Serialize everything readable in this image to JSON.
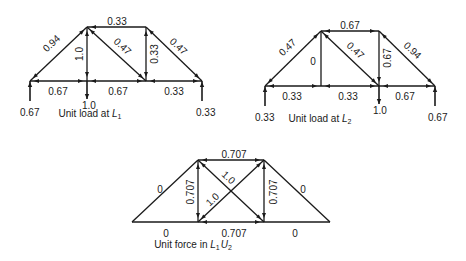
{
  "figure": {
    "trusses": [
      {
        "id": "unit-load-L1",
        "caption": "Unit load at ",
        "caption_sym": "L",
        "caption_sub": "1",
        "caption_sym2": "",
        "caption_sub2": "",
        "caption_pos": [
          90,
          117
        ],
        "nodes": {
          "L0": [
            30,
            81
          ],
          "U1": [
            87,
            27
          ],
          "L1": [
            87,
            81
          ],
          "U2": [
            146,
            27
          ],
          "L2": [
            146,
            81
          ],
          "L3": [
            202,
            81
          ]
        },
        "members": [
          {
            "from": "L0",
            "to": "U1",
            "label": "0.94",
            "lpos": [
              52,
              44
            ],
            "rot": -43,
            "arrows": [
              "L0",
              "U1"
            ]
          },
          {
            "from": "U1",
            "to": "L1",
            "label": "1.0",
            "lpos": [
              80,
              54
            ],
            "rot": -90,
            "arrows": [
              "U1",
              "L1"
            ]
          },
          {
            "from": "U1",
            "to": "U2",
            "label": "0.33",
            "lpos": [
              117,
              22
            ],
            "rot": 0,
            "arrows": [
              "U1"
            ]
          },
          {
            "from": "U1",
            "to": "L2",
            "label": "0.47",
            "lpos": [
              122,
              47
            ],
            "rot": 43,
            "arrows": [
              "U1",
              "L2"
            ]
          },
          {
            "from": "U2",
            "to": "L2",
            "label": "0.33",
            "lpos": [
              155,
              54
            ],
            "rot": -90,
            "arrows": [
              "U2",
              "L2"
            ]
          },
          {
            "from": "U2",
            "to": "L3",
            "label": "0.47",
            "lpos": [
              178,
              47
            ],
            "rot": 43,
            "arrows": [
              "U2",
              "L3"
            ]
          },
          {
            "from": "L0",
            "to": "L1",
            "label": "0.67",
            "lpos": [
              58,
              92
            ],
            "rot": 0,
            "arrows": [
              "L0",
              "L1"
            ]
          },
          {
            "from": "L1",
            "to": "L2",
            "label": "0.67",
            "lpos": [
              118,
              92
            ],
            "rot": 0,
            "arrows": [
              "L1",
              "L2"
            ]
          },
          {
            "from": "L2",
            "to": "L3",
            "label": "0.33",
            "lpos": [
              174,
              92
            ],
            "rot": 0,
            "arrows": [
              "L2",
              "L3"
            ]
          }
        ],
        "loads": [
          {
            "node": "L0",
            "dir": "up",
            "len": 20,
            "label": "0.67",
            "lpos": [
              20,
              116
            ]
          },
          {
            "node": "L1",
            "dir": "down",
            "len": 18,
            "label": "1.0",
            "lpos": [
              82,
              109
            ]
          },
          {
            "node": "L3",
            "dir": "up",
            "len": 20,
            "label": "0.33",
            "lpos": [
              196,
              116
            ]
          }
        ]
      },
      {
        "id": "unit-load-L2",
        "caption": "Unit load at ",
        "caption_sym": "L",
        "caption_sub": "2",
        "caption_sym2": "",
        "caption_sub2": "",
        "caption_pos": [
          320,
          122
        ],
        "nodes": {
          "L0": [
            265,
            86
          ],
          "U1": [
            321,
            31
          ],
          "L1": [
            321,
            86
          ],
          "U2": [
            379,
            31
          ],
          "L2": [
            379,
            86
          ],
          "L3": [
            435,
            86
          ]
        },
        "members": [
          {
            "from": "L0",
            "to": "U1",
            "label": "0.47",
            "lpos": [
              288,
              48
            ],
            "rot": -43,
            "arrows": [
              "L0",
              "U1"
            ]
          },
          {
            "from": "U1",
            "to": "L1",
            "label": "0",
            "lpos": [
              313,
              62
            ],
            "rot": 0,
            "arrows": []
          },
          {
            "from": "U1",
            "to": "U2",
            "label": "0.67",
            "lpos": [
              350,
              26
            ],
            "rot": 0,
            "arrows": [
              "U1",
              "U2"
            ]
          },
          {
            "from": "U1",
            "to": "L2",
            "label": "0.47",
            "lpos": [
              355,
              51
            ],
            "rot": 43,
            "arrows": [
              "U1",
              "L2"
            ]
          },
          {
            "from": "U2",
            "to": "L2",
            "label": "0.67",
            "lpos": [
              388,
              58
            ],
            "rot": -90,
            "arrows": [
              "L2"
            ]
          },
          {
            "from": "U2",
            "to": "L3",
            "label": "0.94",
            "lpos": [
              412,
              51
            ],
            "rot": 43,
            "arrows": [
              "U2",
              "L3"
            ]
          },
          {
            "from": "L0",
            "to": "L1",
            "label": "0.33",
            "lpos": [
              292,
              97
            ],
            "rot": 0,
            "arrows": [
              "L0",
              "L1"
            ]
          },
          {
            "from": "L1",
            "to": "L2",
            "label": "0.33",
            "lpos": [
              348,
              97
            ],
            "rot": 0,
            "arrows": [
              "L1",
              "L2"
            ]
          },
          {
            "from": "L2",
            "to": "L3",
            "label": "0.67",
            "lpos": [
              405,
              97
            ],
            "rot": 0,
            "arrows": [
              "L2",
              "L3"
            ]
          }
        ],
        "loads": [
          {
            "node": "L0",
            "dir": "up",
            "len": 20,
            "label": "0.33",
            "lpos": [
              255,
              121
            ]
          },
          {
            "node": "L2",
            "dir": "down",
            "len": 18,
            "label": "1.0",
            "lpos": [
              373,
              114
            ]
          },
          {
            "node": "L3",
            "dir": "up",
            "len": 20,
            "label": "0.67",
            "lpos": [
              428,
              121
            ]
          }
        ]
      },
      {
        "id": "unit-force-L1U2",
        "caption": "Unit force in ",
        "caption_sym": "L",
        "caption_sub": "1",
        "caption_sym2": "U",
        "caption_sub2": "2",
        "caption_pos": [
          193,
          248
        ],
        "nodes": {
          "L0": [
            132,
            222
          ],
          "U1": [
            198,
            160
          ],
          "L1": [
            198,
            222
          ],
          "U2": [
            264,
            160
          ],
          "L2": [
            264,
            222
          ],
          "L3": [
            330,
            222
          ]
        },
        "members": [
          {
            "from": "L0",
            "to": "U1",
            "label": "0",
            "lpos": [
              160,
              190
            ],
            "rot": 0,
            "arrows": []
          },
          {
            "from": "U1",
            "to": "L1",
            "label": "0.707",
            "lpos": [
              191,
              192
            ],
            "rot": -90,
            "arrows": [
              "U1",
              "L1"
            ]
          },
          {
            "from": "U1",
            "to": "U2",
            "label": "0.707",
            "lpos": [
              234,
              155
            ],
            "rot": 0,
            "arrows": [
              "U1",
              "U2"
            ]
          },
          {
            "from": "U1",
            "to": "L2",
            "label": "1.0",
            "lpos": [
              228,
              178
            ],
            "rot": 43,
            "arrows": [
              "U1",
              "L2"
            ]
          },
          {
            "from": "L1",
            "to": "U2",
            "label": "1.0",
            "lpos": [
              213,
              200
            ],
            "rot": -43,
            "arrows": [
              "L1",
              "U2"
            ]
          },
          {
            "from": "U2",
            "to": "L2",
            "label": "0.707",
            "lpos": [
              274,
              192
            ],
            "rot": -90,
            "arrows": [
              "U2",
              "L2"
            ]
          },
          {
            "from": "U2",
            "to": "L3",
            "label": "0",
            "lpos": [
              303,
              190
            ],
            "rot": 0,
            "arrows": []
          },
          {
            "from": "L0",
            "to": "L1",
            "label": "0",
            "lpos": [
              166,
              234
            ],
            "rot": 0,
            "arrows": []
          },
          {
            "from": "L1",
            "to": "L2",
            "label": "0.707",
            "lpos": [
              234,
              234
            ],
            "rot": 0,
            "arrows": [
              "L1",
              "L2"
            ]
          },
          {
            "from": "L2",
            "to": "L3",
            "label": "0",
            "lpos": [
              295,
              234
            ],
            "rot": 0,
            "arrows": []
          }
        ],
        "loads": []
      }
    ]
  }
}
